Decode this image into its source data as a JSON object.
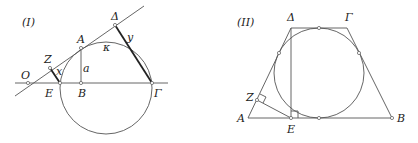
{
  "figures": [
    {
      "id": "I",
      "title": "(I)",
      "points": {
        "O": "O",
        "E": "E",
        "B": "B",
        "Gamma": "Γ",
        "A": "A",
        "Delta": "Δ",
        "Z": "Z"
      },
      "segment_labels": {
        "x": "x",
        "y": "y",
        "a": "a"
      },
      "circle_label": "κ"
    },
    {
      "id": "II",
      "title": "(II)",
      "points": {
        "Delta": "Δ",
        "Gamma": "Γ",
        "A": "A",
        "B": "B",
        "E": "E",
        "Z": "Z"
      }
    }
  ]
}
